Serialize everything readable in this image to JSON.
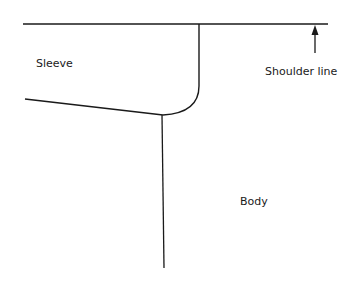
{
  "diagram": {
    "type": "pattern-drafting-sketch",
    "labels": {
      "sleeve": "Sleeve",
      "shoulder_line": "Shoulder line",
      "body": "Body"
    },
    "colors": {
      "stroke": "#1a1a1a",
      "background": "#ffffff"
    }
  }
}
